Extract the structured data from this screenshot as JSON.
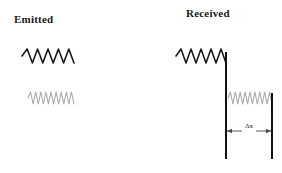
{
  "figure": {
    "title_left": "Emitted",
    "title_right": "Received",
    "background_color": "#ffffff"
  },
  "colors": {
    "wave_dark": "#1a1a1a",
    "wave_gray": "#a9a9a9",
    "barrier": "#111111",
    "arrow": "#4a4a4a",
    "text": "#1a1a1a"
  },
  "waves": {
    "emitted_dark": {
      "name": "emitted-short-wavelength-wave",
      "color": "#1a1a1a",
      "cycles": 5,
      "width": 52,
      "amplitude": 7,
      "stroke": 1.6
    },
    "emitted_gray": {
      "name": "emitted-long-wave-faint",
      "color": "#a9a9a9",
      "cycles": 9,
      "width": 46,
      "amplitude": 6,
      "stroke": 1.1
    },
    "received_dark": {
      "name": "received-wave",
      "color": "#1a1a1a",
      "cycles": 5,
      "width": 50,
      "amplitude": 7,
      "stroke": 1.6
    },
    "received_gray": {
      "name": "received-wave-faint",
      "color": "#a9a9a9",
      "cycles": 9,
      "width": 44,
      "amplitude": 6,
      "stroke": 1.1
    }
  },
  "barriers": {
    "left_label": "left-barrier",
    "right_label": "right-barrier"
  },
  "dimension": {
    "label": "Δx",
    "arrow_color": "#4a4a4a"
  }
}
